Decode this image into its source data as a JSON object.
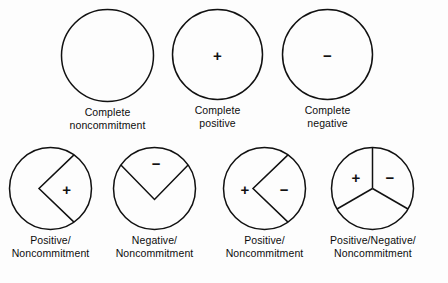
{
  "figure": {
    "background_color": "#fdfdfd",
    "stroke_color": "#111111"
  },
  "symbols": {
    "plus": "+",
    "minus": "−"
  },
  "top_row": [
    {
      "id": "complete-noncommitment",
      "caption": "Complete\nnoncommitment",
      "diameter": 95,
      "partition": "none",
      "marks": []
    },
    {
      "id": "complete-positive",
      "caption": "Complete\npositive",
      "diameter": 93,
      "partition": "none",
      "marks": [
        {
          "symbol": "+",
          "x_pct": 50,
          "y_pct": 50
        }
      ]
    },
    {
      "id": "complete-negative",
      "caption": "Complete\nnegative",
      "diameter": 93,
      "partition": "none",
      "marks": [
        {
          "symbol": "−",
          "x_pct": 50,
          "y_pct": 50
        }
      ]
    }
  ],
  "bottom_row": [
    {
      "id": "positive-noncommitment",
      "caption": "Positive/\nNoncommitment",
      "diameter": 85,
      "partition": "wedge-right",
      "wedge_start_deg": -55,
      "wedge_end_deg": 55,
      "marks": [
        {
          "symbol": "+",
          "x_pct": 69,
          "y_pct": 50
        }
      ]
    },
    {
      "id": "negative-noncommitment",
      "caption": "Negative/\nNoncommitment",
      "diameter": 85,
      "partition": "wedge-top",
      "wedge_start_deg": 215,
      "wedge_end_deg": 325,
      "marks": [
        {
          "symbol": "−",
          "x_pct": 52,
          "y_pct": 20
        }
      ]
    },
    {
      "id": "positive-noncommitment-2",
      "caption": "Positive/\nNoncommitment",
      "diameter": 85,
      "partition": "wedge-right",
      "wedge_start_deg": -55,
      "wedge_end_deg": 55,
      "marks": [
        {
          "symbol": "+",
          "x_pct": 27,
          "y_pct": 50
        },
        {
          "symbol": "−",
          "x_pct": 73,
          "y_pct": 50
        }
      ]
    },
    {
      "id": "positive-negative-noncommitment",
      "caption": "Positive/Negative/\nNoncommitment",
      "diameter": 85,
      "partition": "thirds",
      "spoke_angles_deg": [
        270,
        30,
        150
      ],
      "marks": [
        {
          "symbol": "+",
          "x_pct": 30,
          "y_pct": 36
        },
        {
          "symbol": "−",
          "x_pct": 70,
          "y_pct": 36
        }
      ]
    }
  ]
}
